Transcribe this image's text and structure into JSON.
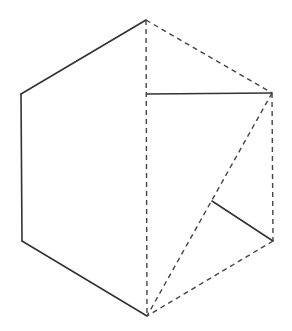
{
  "diagram": {
    "colors": {
      "stroke": "#333333",
      "background": "#ffffff"
    },
    "vertices": {
      "top": [
        146,
        20
      ],
      "upper_right": [
        272,
        93
      ],
      "lower_right": [
        273,
        241
      ],
      "bottom": [
        147,
        316
      ],
      "lower_left": [
        22,
        241
      ],
      "upper_left": [
        21,
        94
      ],
      "mid_vertical": [
        147,
        94
      ],
      "inner_point": [
        212,
        201
      ]
    },
    "solid_segments": [
      {
        "name": "edge-upper-left",
        "from": [
          146,
          20
        ],
        "to": [
          21,
          94
        ]
      },
      {
        "name": "edge-left",
        "from": [
          21,
          94
        ],
        "to": [
          22,
          241
        ]
      },
      {
        "name": "edge-lower-left",
        "from": [
          22,
          241
        ],
        "to": [
          147,
          316
        ]
      },
      {
        "name": "horizontal-fold",
        "from": [
          147,
          94
        ],
        "to": [
          272,
          93
        ]
      },
      {
        "name": "inner-fold",
        "from": [
          212,
          201
        ],
        "to": [
          273,
          241
        ]
      }
    ],
    "dashed_segments": [
      {
        "name": "vertical-center",
        "from": [
          146,
          20
        ],
        "to": [
          147,
          316
        ]
      },
      {
        "name": "edge-upper-right",
        "from": [
          146,
          20
        ],
        "to": [
          272,
          93
        ]
      },
      {
        "name": "edge-right",
        "from": [
          272,
          93
        ],
        "to": [
          273,
          241
        ]
      },
      {
        "name": "edge-lower-right",
        "from": [
          273,
          241
        ],
        "to": [
          147,
          316
        ]
      },
      {
        "name": "diagonal",
        "from": [
          272,
          93
        ],
        "to": [
          147,
          316
        ]
      }
    ]
  }
}
